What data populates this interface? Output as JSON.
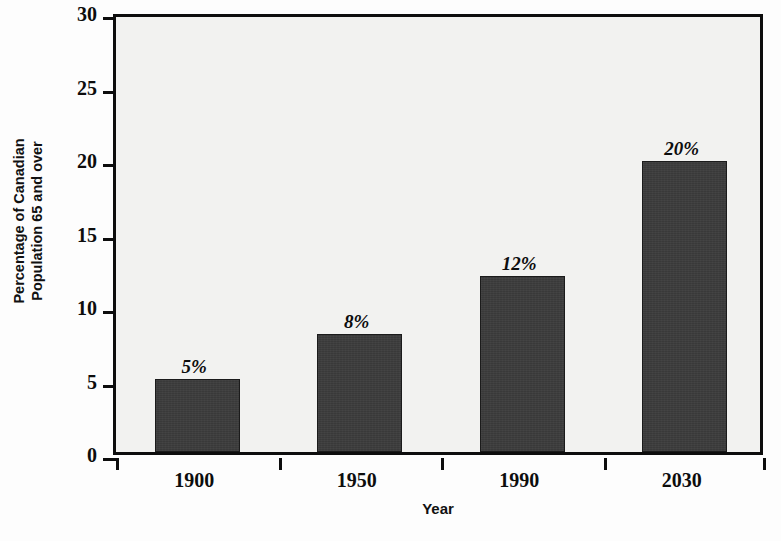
{
  "chart_data": {
    "type": "bar",
    "title": "",
    "xlabel": "Year",
    "ylabel_line1": "Percentage of Canadian",
    "ylabel_line2": "Population 65 and over",
    "categories": [
      "1900",
      "1950",
      "1990",
      "2030"
    ],
    "values": [
      5,
      8,
      12,
      19.8
    ],
    "data_labels": [
      "5%",
      "8%",
      "12%",
      "20%"
    ],
    "ylim": [
      0,
      30
    ],
    "ytick_labels": [
      "0",
      "5",
      "10",
      "15",
      "20",
      "25",
      "30"
    ],
    "ytick_values": [
      0,
      5,
      10,
      15,
      20,
      25,
      30
    ],
    "grid": false,
    "legend": "none",
    "bar_color": "#3c3c3c",
    "plot_background": "#f2f2f0",
    "axis_color": "#0d0d0d"
  }
}
